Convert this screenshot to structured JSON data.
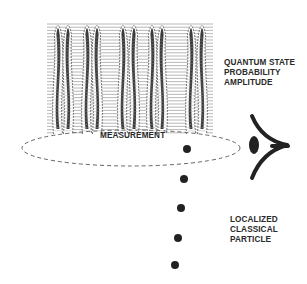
{
  "diagram": {
    "labels": {
      "quantum_state": [
        "QUANTUM STATE",
        "PROBABILITY",
        "AMPLITUDE"
      ],
      "measurement": "MEASUREMENT",
      "particle": [
        "LOCALIZED",
        "CLASSICAL",
        "PARTICLE"
      ]
    },
    "wave_block": {
      "x": 47,
      "y": 20,
      "width": 166,
      "height": 114,
      "line_spacing": 3.2,
      "line_color": "#9a9a9a",
      "peak_x": [
        58,
        68,
        87,
        97,
        123,
        134,
        152,
        162,
        191,
        202
      ],
      "wave_color": "#1a1a1a"
    },
    "measurement_ellipse": {
      "cx": 131,
      "cy": 148,
      "rx": 109,
      "ry": 18,
      "stroke": "#666666",
      "dash": "4,3"
    },
    "particles": [
      {
        "x": 187,
        "y": 149
      },
      {
        "x": 184,
        "y": 179
      },
      {
        "x": 181,
        "y": 208
      },
      {
        "x": 178,
        "y": 238
      },
      {
        "x": 175,
        "y": 265
      }
    ],
    "particle_radius": 4,
    "particle_color": "#222222",
    "observer_icon": "eye-icon"
  }
}
